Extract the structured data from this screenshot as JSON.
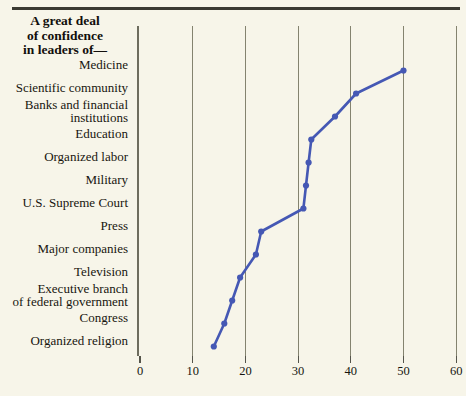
{
  "title": {
    "line1": "A great deal",
    "line2": "of confidence",
    "line3": "in leaders of—"
  },
  "axis": {
    "ticks": [
      "0",
      "10",
      "20",
      "30",
      "40",
      "50",
      "60"
    ]
  },
  "colors": {
    "background": "#f7f5e9",
    "series": "#4558b4",
    "gridline": "#84836f",
    "axis": "#6e6d5e",
    "rule": "#3b3a32",
    "text": "#17150f"
  },
  "chart_data": {
    "type": "line",
    "title": "A great deal of confidence in leaders of—",
    "xlabel": "",
    "ylabel": "",
    "xlim": [
      0,
      60
    ],
    "xticks": [
      0,
      10,
      20,
      30,
      40,
      50,
      60
    ],
    "grid": true,
    "legend": "none",
    "orientation": "horizontal",
    "categories": [
      "Medicine",
      "Scientific community",
      "Banks and financial institutions",
      "Education",
      "Organized labor",
      "Military",
      "U.S. Supreme Court",
      "Press",
      "Major companies",
      "Television",
      "Executive branch of federal government",
      "Congress",
      "Organized religion"
    ],
    "category_lines": [
      [
        "Medicine"
      ],
      [
        "Scientific community"
      ],
      [
        "Banks and financial",
        "institutions"
      ],
      [
        "Education"
      ],
      [
        "Organized labor"
      ],
      [
        "Military"
      ],
      [
        "U.S. Supreme Court"
      ],
      [
        "Press"
      ],
      [
        "Major companies"
      ],
      [
        "Television"
      ],
      [
        "Executive branch",
        "of federal government"
      ],
      [
        "Congress"
      ],
      [
        "Organized religion"
      ]
    ],
    "values": [
      50,
      41,
      37,
      32.5,
      32,
      31.5,
      31,
      23,
      22,
      19,
      17.5,
      16,
      14
    ]
  }
}
